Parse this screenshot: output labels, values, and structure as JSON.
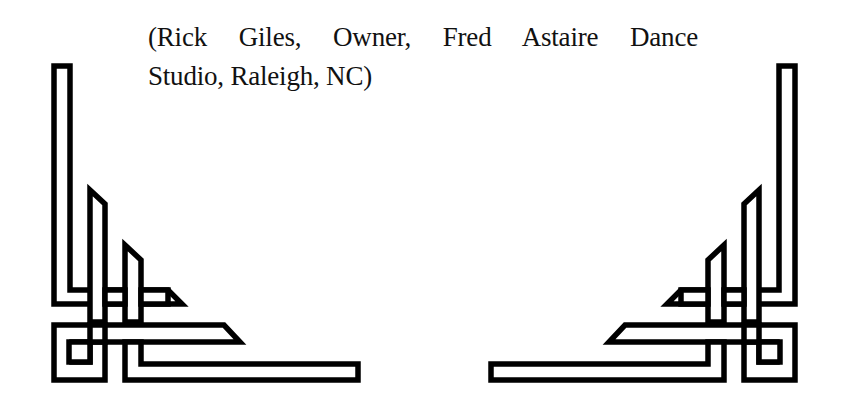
{
  "document": {
    "attribution_lines": [
      "(Rick Giles, Owner, Fred Astaire Dance",
      "Studio, Raleigh, NC)"
    ],
    "attribution_full": "(Rick Giles, Owner, Fred Astaire Dance Studio, Raleigh, NC)"
  },
  "decorations": {
    "left": "corner-ornament-bottom-left",
    "right": "corner-ornament-bottom-right",
    "stroke_color": "#000000",
    "fill_color": "#ffffff"
  }
}
